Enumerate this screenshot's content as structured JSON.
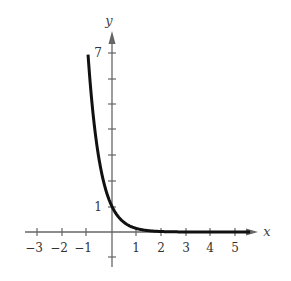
{
  "chart_data": {
    "type": "line",
    "title": "",
    "function": "y = e^(-2x)",
    "xlabel": "x",
    "ylabel": "y",
    "xlim": [
      -3.5,
      5.9
    ],
    "ylim": [
      -1.3,
      7.9
    ],
    "x_ticks": [
      -3,
      -2,
      -1,
      0,
      1,
      2,
      3,
      4,
      5
    ],
    "x_tick_labels": [
      "−3",
      "−2",
      "−1",
      "1",
      "2",
      "3",
      "4",
      "5"
    ],
    "y_ticks": [
      -1,
      1,
      2,
      3,
      4,
      5,
      6,
      7
    ],
    "y_tick_labels": [
      "1",
      "7"
    ],
    "grid": false,
    "series": [
      {
        "name": "curve",
        "x": [
          -0.95,
          -0.75,
          -0.5,
          -0.25,
          0,
          0.25,
          0.5,
          0.75,
          1,
          1.5,
          2,
          3,
          4,
          5,
          5.6
        ],
        "y": [
          6.69,
          4.48,
          2.72,
          1.65,
          1,
          0.61,
          0.37,
          0.22,
          0.14,
          0.05,
          0.02,
          0.0,
          0.0,
          0.0,
          0.0
        ]
      }
    ],
    "color": "#111111"
  },
  "labels": {
    "x_axis": "x",
    "y_axis": "y",
    "xt": {
      "m3": "−3",
      "m2": "−2",
      "m1": "−1",
      "p1": "1",
      "p2": "2",
      "p3": "3",
      "p4": "4",
      "p5": "5"
    },
    "yt": {
      "p1": "1",
      "p7": "7"
    }
  }
}
